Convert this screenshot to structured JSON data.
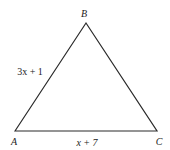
{
  "diagram": {
    "type": "triangle",
    "stroke_color": "#2a2a2a",
    "vertices": [
      {
        "name": "A",
        "x": 15,
        "y": 131
      },
      {
        "name": "B",
        "x": 86,
        "y": 23
      },
      {
        "name": "C",
        "x": 157,
        "y": 131
      }
    ],
    "vertex_labels": {
      "A": "A",
      "B": "B",
      "C": "C"
    },
    "side_labels": {
      "AB": "3x + 1",
      "AC": "x + 7"
    }
  }
}
